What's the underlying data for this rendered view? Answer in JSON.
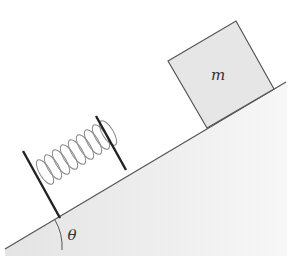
{
  "diagram": {
    "type": "inclined-plane-spring-block",
    "block": {
      "label": "m",
      "fill": "#e6e6e6",
      "stroke": "#555555"
    },
    "angle": {
      "label": "θ"
    },
    "spring": {
      "coils": 7,
      "color": "#888888",
      "plate_color": "#222222"
    },
    "incline": {
      "fill": "#ececec",
      "stroke": "#555555"
    }
  }
}
